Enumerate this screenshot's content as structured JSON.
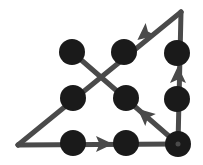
{
  "figure": {
    "width": 203,
    "height": 165,
    "background_color": "#ffffff",
    "edge_color": "#4a4a4a",
    "node_color": "#1a1a1a",
    "arrow_color": "#4a4a4a",
    "edge_width": 5,
    "node_radius": 12
  },
  "vertices": {
    "left": {
      "label": "left-vertex",
      "x": 18,
      "y": 145
    },
    "top_right": {
      "label": "top-right-vertex",
      "x": 181,
      "y": 12
    },
    "bottom_right": {
      "label": "bottom-right-vertex",
      "x": 178,
      "y": 144
    }
  },
  "nodes": [
    {
      "id": "node-top-left",
      "label": "node-top-left",
      "x": 72,
      "y": 52,
      "r": 13
    },
    {
      "id": "node-top-middle",
      "label": "node-top-middle",
      "x": 124,
      "y": 52,
      "r": 13
    },
    {
      "id": "node-top-right",
      "label": "node-top-right",
      "x": 177,
      "y": 53,
      "r": 13
    },
    {
      "id": "node-middle-left",
      "label": "node-middle-left",
      "x": 73,
      "y": 98,
      "r": 13
    },
    {
      "id": "node-middle-center",
      "label": "node-middle-center",
      "x": 126,
      "y": 98,
      "r": 13
    },
    {
      "id": "node-middle-right",
      "label": "node-middle-right",
      "x": 177,
      "y": 99,
      "r": 13
    },
    {
      "id": "node-bottom-left",
      "label": "node-bottom-left",
      "x": 73,
      "y": 143,
      "r": 13
    },
    {
      "id": "node-bottom-middle",
      "label": "node-bottom-middle",
      "x": 126,
      "y": 143,
      "r": 13
    },
    {
      "id": "node-bottom-right",
      "label": "node-bottom-right",
      "x": 178,
      "y": 144,
      "r": 13
    }
  ],
  "edges": [
    {
      "id": "edge-bottom",
      "label": "bottom-horizontal-edge",
      "x1": 18,
      "y1": 145,
      "x2": 178,
      "y2": 144,
      "direction": "rightward"
    },
    {
      "id": "edge-right",
      "label": "right-vertical-edge",
      "x1": 178,
      "y1": 144,
      "x2": 181,
      "y2": 12,
      "direction": "upward"
    },
    {
      "id": "edge-hypotenuse",
      "label": "hypotenuse-diagonal-edge",
      "x1": 181,
      "y1": 12,
      "x2": 18,
      "y2": 145,
      "direction": "down-left"
    },
    {
      "id": "edge-cross-diagonal",
      "label": "cross-diagonal-edge",
      "x1": 72,
      "y1": 52,
      "x2": 178,
      "y2": 144,
      "direction": "up-left"
    }
  ],
  "arrows": [
    {
      "id": "arrow-bottom",
      "label": "arrow-bottom-rightward",
      "x": 102,
      "y": 144,
      "angle": 0
    },
    {
      "id": "arrow-right",
      "label": "arrow-right-upward",
      "x": 178,
      "y": 77,
      "angle": -90
    },
    {
      "id": "arrow-hypotenuse",
      "label": "arrow-hypotenuse-downleft",
      "x": 146,
      "y": 33,
      "angle": 141
    },
    {
      "id": "arrow-cross",
      "label": "arrow-cross-diagonal-upleft",
      "x": 146,
      "y": 116,
      "angle": 221
    }
  ]
}
